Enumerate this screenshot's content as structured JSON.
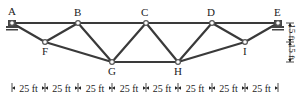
{
  "diagram": {
    "type": "truss",
    "colors": {
      "member": "#3a3a3a",
      "joint": "#555555",
      "support": "#444444",
      "text": "#222222",
      "background": "#ffffff"
    },
    "nodes": [
      {
        "id": "A",
        "label": "A",
        "x": 12,
        "y": 23,
        "label_x": 8,
        "label_y": 15
      },
      {
        "id": "B",
        "label": "B",
        "x": 78,
        "y": 23,
        "label_x": 74,
        "label_y": 16
      },
      {
        "id": "C",
        "label": "C",
        "x": 146,
        "y": 23,
        "label_x": 141,
        "label_y": 16
      },
      {
        "id": "D",
        "label": "D",
        "x": 212,
        "y": 23,
        "label_x": 207,
        "label_y": 16
      },
      {
        "id": "E",
        "label": "E",
        "x": 278,
        "y": 23,
        "label_x": 274,
        "label_y": 16
      },
      {
        "id": "F",
        "label": "F",
        "x": 45,
        "y": 42,
        "label_x": 42,
        "label_y": 55
      },
      {
        "id": "G",
        "label": "G",
        "x": 112,
        "y": 62,
        "label_x": 108,
        "label_y": 75
      },
      {
        "id": "H",
        "label": "H",
        "x": 178,
        "y": 62,
        "label_x": 174,
        "label_y": 75
      },
      {
        "id": "I",
        "label": "I",
        "x": 245,
        "y": 42,
        "label_x": 243,
        "label_y": 55
      }
    ],
    "members": [
      [
        "A",
        "B"
      ],
      [
        "B",
        "C"
      ],
      [
        "C",
        "D"
      ],
      [
        "D",
        "E"
      ],
      [
        "A",
        "F"
      ],
      [
        "F",
        "B"
      ],
      [
        "F",
        "G"
      ],
      [
        "B",
        "G"
      ],
      [
        "G",
        "C"
      ],
      [
        "G",
        "H"
      ],
      [
        "C",
        "H"
      ],
      [
        "H",
        "D"
      ],
      [
        "D",
        "I"
      ],
      [
        "H",
        "I"
      ],
      [
        "I",
        "E"
      ]
    ],
    "supports": [
      {
        "node": "A",
        "type": "pin"
      },
      {
        "node": "E",
        "type": "roller"
      }
    ],
    "horizontal_dimensions": {
      "y": 88,
      "ticks": [
        12,
        45,
        78,
        112,
        146,
        178,
        212,
        245,
        278
      ],
      "segments": [
        "25 ft",
        "25 ft",
        "25 ft",
        "25 ft",
        "25 ft",
        "25 ft",
        "25 ft",
        "25 ft"
      ]
    },
    "vertical_dimensions": {
      "x": 290,
      "ticks": [
        23,
        42,
        62
      ],
      "segments": [
        "15 ft",
        "15 ft"
      ]
    }
  }
}
